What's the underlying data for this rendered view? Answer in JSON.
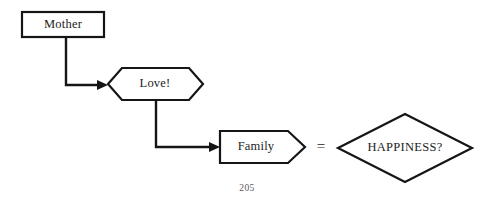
{
  "page": {
    "width": 494,
    "height": 205,
    "background_color": "#ffffff",
    "page_number": "205"
  },
  "diagram": {
    "title": "",
    "stroke_color": "#151515",
    "text_color": "#1c1c1c",
    "fill_color": "#ffffff",
    "nodes": [
      {
        "id": "mother",
        "label": "Mother",
        "shape": "rectangle",
        "x": 22,
        "y": 12,
        "width": 82,
        "height": 25
      },
      {
        "id": "love",
        "label": "Love!",
        "shape": "hexagon",
        "x": 108,
        "y": 68,
        "width": 95,
        "height": 32
      },
      {
        "id": "family",
        "label": "Family",
        "shape": "pentagon-arrow",
        "x": 220,
        "y": 131,
        "width": 85,
        "height": 32
      },
      {
        "id": "happiness",
        "label": "HAPPINESS?",
        "shape": "diamond",
        "x": 338,
        "y": 114,
        "width": 134,
        "height": 68
      }
    ],
    "connectors": [
      {
        "id": "mother-to-love",
        "from": "mother",
        "to": "love",
        "style": "elbow-down-right",
        "arrowhead": true
      },
      {
        "id": "love-to-family",
        "from": "love",
        "to": "family",
        "style": "elbow-down-right",
        "arrowhead": true
      }
    ],
    "operators": [
      {
        "id": "equals",
        "symbol": "=",
        "x": 321,
        "y": 147
      }
    ]
  }
}
